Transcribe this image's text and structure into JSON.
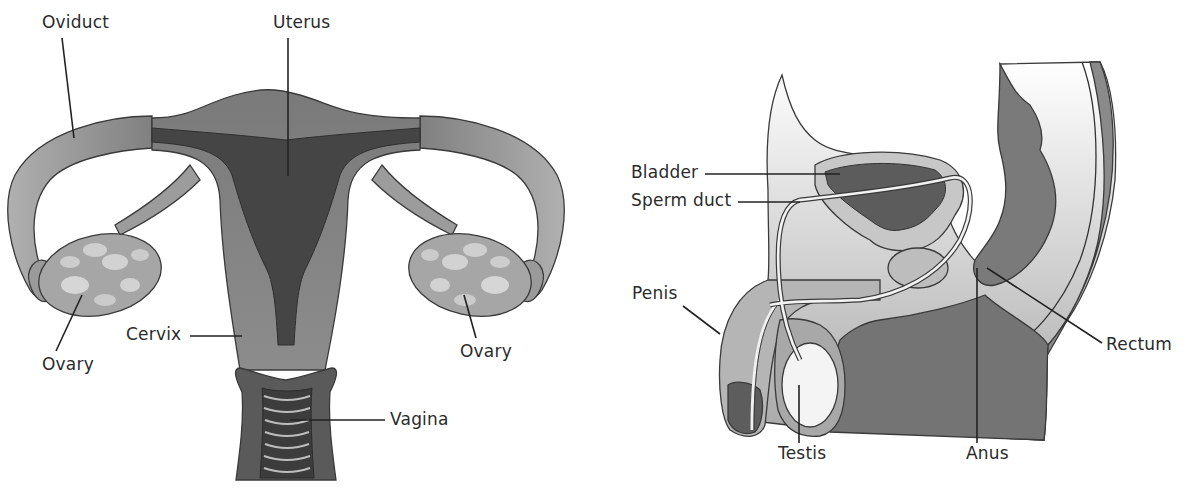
{
  "diagram": {
    "female": {
      "title": "Female reproductive system",
      "labels": {
        "oviduct": "Oviduct",
        "uterus": "Uterus",
        "ovary_left": "Ovary",
        "ovary_right": "Ovary",
        "cervix": "Cervix",
        "vagina": "Vagina"
      }
    },
    "male": {
      "title": "Male reproductive system",
      "labels": {
        "bladder": "Bladder",
        "sperm_duct": "Sperm duct",
        "penis": "Penis",
        "testis": "Testis",
        "anus": "Anus",
        "rectum": "Rectum"
      }
    },
    "colors": {
      "tissue_light": "#bdbdbd",
      "tissue_mid": "#8f8f8f",
      "tissue_dark": "#555555",
      "cavity": "#454545",
      "outline": "#3a3a3a",
      "label_text": "#2b2b2b",
      "background": "#ffffff"
    }
  }
}
